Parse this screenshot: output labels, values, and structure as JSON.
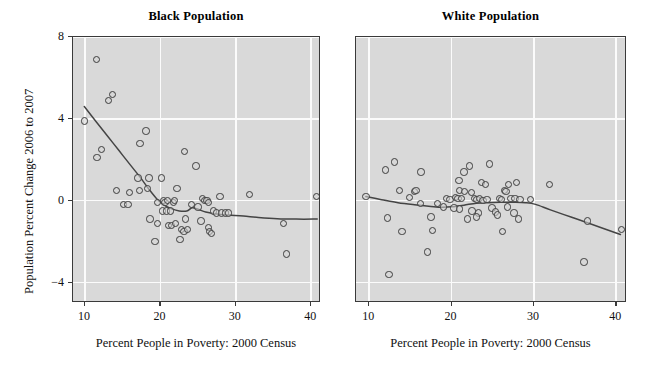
{
  "figure": {
    "width": 645,
    "height": 365,
    "background": "#ffffff",
    "panel_background": "#d9d9d9",
    "frame_color": "#3a3a3a",
    "grid_color": "#fbfbfb",
    "point_color": "#3d3d3d",
    "trend_color": "#444444"
  },
  "shared": {
    "xlabel": "Percent People in Poverty: 2000 Census",
    "ylabel": "Population Percent Change 2006 to 2007",
    "x_ticks": [
      10,
      20,
      30,
      40
    ],
    "y_ticks": [
      8,
      4,
      0,
      -4
    ],
    "xlim": [
      8.4,
      41.3
    ],
    "ylim": [
      -5.0,
      8.0
    ]
  },
  "chart_data": [
    {
      "type": "scatter",
      "title": "Black Population",
      "xlabel": "Percent People in Poverty: 2000 Census",
      "ylabel": "Population Percent Change 2006 to 2007",
      "xlim": [
        8.4,
        41.3
      ],
      "ylim": [
        -5.0,
        8.0
      ],
      "xticks": [
        10,
        20,
        30,
        40
      ],
      "yticks": [
        8,
        4,
        0,
        -4
      ],
      "grid": true,
      "legend": "none",
      "points": [
        [
          11.5,
          6.9
        ],
        [
          13.1,
          4.9
        ],
        [
          13.6,
          5.2
        ],
        [
          9.9,
          3.9
        ],
        [
          12.2,
          2.5
        ],
        [
          11.6,
          2.1
        ],
        [
          17.3,
          2.8
        ],
        [
          18.1,
          3.4
        ],
        [
          23.2,
          2.4
        ],
        [
          24.7,
          1.7
        ],
        [
          17.0,
          1.1
        ],
        [
          18.5,
          1.1
        ],
        [
          20.1,
          1.1
        ],
        [
          18.3,
          0.6
        ],
        [
          22.2,
          0.6
        ],
        [
          14.2,
          0.5
        ],
        [
          15.9,
          0.4
        ],
        [
          17.2,
          0.5
        ],
        [
          27.9,
          0.2
        ],
        [
          31.8,
          0.3
        ],
        [
          40.7,
          0.2
        ],
        [
          15.1,
          -0.2
        ],
        [
          15.7,
          -0.2
        ],
        [
          19.6,
          -0.1
        ],
        [
          20.4,
          0.0
        ],
        [
          20.6,
          -0.1
        ],
        [
          20.9,
          0.0
        ],
        [
          21.7,
          -0.1
        ],
        [
          21.9,
          0.0
        ],
        [
          24.1,
          -0.2
        ],
        [
          25.0,
          -0.3
        ],
        [
          25.6,
          0.1
        ],
        [
          25.9,
          0.0
        ],
        [
          26.2,
          0.0
        ],
        [
          26.4,
          -0.1
        ],
        [
          20.3,
          -0.5
        ],
        [
          20.8,
          -0.5
        ],
        [
          21.3,
          -0.5
        ],
        [
          27.0,
          -0.5
        ],
        [
          27.4,
          -0.6
        ],
        [
          28.1,
          -0.6
        ],
        [
          28.6,
          -0.6
        ],
        [
          29.0,
          -0.6
        ],
        [
          18.6,
          -0.9
        ],
        [
          19.6,
          -1.1
        ],
        [
          21.1,
          -1.2
        ],
        [
          21.5,
          -1.2
        ],
        [
          22.0,
          -1.1
        ],
        [
          23.3,
          -0.9
        ],
        [
          22.8,
          -1.4
        ],
        [
          23.1,
          -1.5
        ],
        [
          23.6,
          -1.4
        ],
        [
          25.4,
          -1.0
        ],
        [
          26.4,
          -1.3
        ],
        [
          26.5,
          -1.5
        ],
        [
          26.8,
          -1.6
        ],
        [
          19.3,
          -2.0
        ],
        [
          22.6,
          -1.9
        ],
        [
          36.3,
          -1.1
        ],
        [
          36.7,
          -2.6
        ]
      ],
      "trend": {
        "label": "lowess-smoother",
        "x": [
          9.9,
          11.5,
          13.0,
          14.5,
          16.0,
          17.3,
          18.5,
          19.5,
          20.5,
          21.5,
          22.5,
          23.5,
          24.2,
          25.0,
          26.0,
          27.5,
          29.0,
          31.0,
          33.0,
          35.5,
          38.0,
          40.8
        ],
        "y": [
          4.6,
          3.85,
          3.15,
          2.45,
          1.75,
          1.15,
          0.55,
          0.1,
          -0.22,
          -0.4,
          -0.5,
          -0.5,
          -0.35,
          -0.42,
          -0.55,
          -0.65,
          -0.7,
          -0.75,
          -0.82,
          -0.88,
          -0.9,
          -0.9
        ]
      }
    },
    {
      "type": "scatter",
      "title": "White Population",
      "xlabel": "Percent People in Poverty: 2000 Census",
      "ylabel": "Population Percent Change 2006 to 2007",
      "xlim": [
        8.4,
        41.3
      ],
      "ylim": [
        -5.0,
        8.0
      ],
      "xticks": [
        10,
        20,
        30,
        40
      ],
      "yticks": [
        8,
        4,
        0,
        -4
      ],
      "grid": true,
      "legend": "none",
      "points": [
        [
          13.1,
          1.9
        ],
        [
          12.0,
          1.5
        ],
        [
          16.3,
          1.4
        ],
        [
          21.5,
          1.4
        ],
        [
          22.2,
          1.7
        ],
        [
          24.6,
          1.8
        ],
        [
          20.9,
          1.0
        ],
        [
          23.6,
          0.9
        ],
        [
          24.1,
          0.8
        ],
        [
          26.9,
          0.8
        ],
        [
          27.9,
          0.9
        ],
        [
          31.9,
          0.8
        ],
        [
          13.7,
          0.5
        ],
        [
          15.5,
          0.45
        ],
        [
          15.7,
          0.5
        ],
        [
          21.0,
          0.5
        ],
        [
          21.6,
          0.45
        ],
        [
          22.4,
          0.4
        ],
        [
          26.4,
          0.5
        ],
        [
          26.6,
          0.45
        ],
        [
          9.6,
          0.2
        ],
        [
          14.9,
          0.15
        ],
        [
          16.2,
          -0.15
        ],
        [
          19.4,
          0.1
        ],
        [
          19.8,
          0.05
        ],
        [
          20.5,
          0.15
        ],
        [
          20.8,
          0.1
        ],
        [
          21.2,
          0.1
        ],
        [
          22.8,
          0.1
        ],
        [
          23.1,
          0.05
        ],
        [
          23.4,
          0.1
        ],
        [
          23.8,
          0.0
        ],
        [
          24.3,
          0.05
        ],
        [
          25.8,
          0.1
        ],
        [
          26.1,
          0.05
        ],
        [
          27.2,
          0.1
        ],
        [
          27.7,
          0.1
        ],
        [
          28.3,
          0.05
        ],
        [
          29.6,
          0.05
        ],
        [
          18.3,
          -0.15
        ],
        [
          19.0,
          -0.3
        ],
        [
          20.3,
          -0.35
        ],
        [
          21.0,
          -0.4
        ],
        [
          22.5,
          -0.5
        ],
        [
          23.3,
          -0.6
        ],
        [
          24.9,
          -0.35
        ],
        [
          25.3,
          -0.55
        ],
        [
          25.6,
          -0.7
        ],
        [
          26.8,
          -0.3
        ],
        [
          27.6,
          -0.6
        ],
        [
          12.2,
          -0.85
        ],
        [
          17.5,
          -0.8
        ],
        [
          21.9,
          -0.9
        ],
        [
          23.0,
          -0.8
        ],
        [
          28.1,
          -0.9
        ],
        [
          14.0,
          -1.5
        ],
        [
          17.7,
          -1.45
        ],
        [
          26.2,
          -1.5
        ],
        [
          36.5,
          -1.0
        ],
        [
          40.6,
          -1.4
        ],
        [
          17.1,
          -2.5
        ],
        [
          36.1,
          -3.0
        ],
        [
          12.4,
          -3.6
        ]
      ],
      "trend": {
        "label": "lowess-smoother",
        "x": [
          9.6,
          11.5,
          13.5,
          15.5,
          17.5,
          18.8,
          20.0,
          21.5,
          23.0,
          24.5,
          26.0,
          27.5,
          29.0,
          30.2,
          32.0,
          34.5,
          37.0,
          40.5
        ],
        "y": [
          0.2,
          0.05,
          -0.1,
          -0.2,
          -0.28,
          -0.32,
          -0.3,
          -0.22,
          -0.12,
          -0.1,
          -0.08,
          -0.08,
          -0.1,
          -0.18,
          -0.45,
          -0.8,
          -1.15,
          -1.65
        ]
      }
    }
  ]
}
